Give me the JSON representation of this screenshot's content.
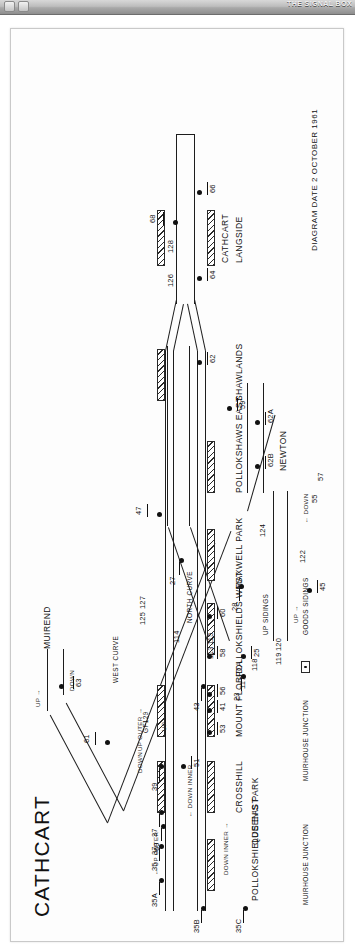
{
  "chrome": {
    "title": "THE SIGNAL BOX",
    "buttons": [
      "back-button",
      "forward-button"
    ]
  },
  "diagram": {
    "title": "CATHCART",
    "date_label": "DIAGRAM DATE 2 OCTOBER 1961",
    "destinations": [
      {
        "name": "MUIREND",
        "arrow": "→"
      },
      {
        "name": "NEWTON",
        "arrow": "←"
      }
    ],
    "line_labels": [
      "UP →",
      "DOWN",
      "DOWN",
      "UP",
      "UP →",
      "← DOWN",
      "UP OUTER →",
      "← DOWN INNER",
      "DOWN INNER →",
      "← UP OUTER"
    ],
    "curves": [
      "WEST CURVE",
      "NORTH CURVE"
    ],
    "sidings": [
      "UP SIDINGS",
      "GOODS SIDINGS"
    ],
    "ground_frame": "GF129",
    "junctions": [
      "MUIRHOUSE JUNCTION",
      "MUIRHOUSE JUNCTION"
    ],
    "stations": [
      "CATHCART",
      "LANGSIDE",
      "SHAWLANDS",
      "POLLOKSHAWS EAST",
      "MAXWELL PARK",
      "POLLOKSHIELDS WEST",
      "MOUNT FLORIDA",
      "CROSSHILL",
      "QUEEN'S PARK",
      "POLLOKSHIELDS EAST"
    ],
    "signals": [
      "63",
      "61",
      "125",
      "127",
      "69",
      "47",
      "68",
      "66",
      "128",
      "126",
      "64",
      "62",
      "114",
      "115",
      "113",
      "23",
      "25",
      "27",
      "28",
      "120",
      "119",
      "124",
      "122",
      "45",
      "55",
      "57",
      "59",
      "62A",
      "62B",
      "43",
      "41",
      "117",
      "118",
      "53",
      "60",
      "58",
      "56",
      "39",
      "51",
      "37",
      "37",
      "35",
      "35A",
      "35B",
      "35C"
    ],
    "colors": {
      "ink": "#1d1d1d",
      "paper": "#fdfdfd",
      "chrome": "#a9a9a9"
    }
  }
}
